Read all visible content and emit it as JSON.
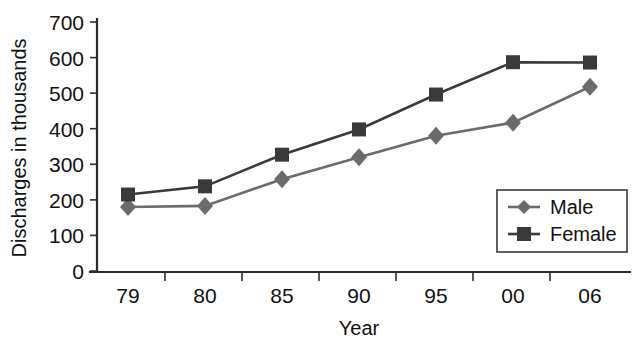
{
  "chart_data": {
    "type": "line",
    "title": "",
    "xlabel": "Year",
    "ylabel": "Discharges in thousands",
    "categories": [
      "79",
      "80",
      "85",
      "90",
      "95",
      "00",
      "06"
    ],
    "series": [
      {
        "name": "Male",
        "marker": "diamond",
        "color": "#6b6b6b",
        "values": [
          180,
          183,
          258,
          320,
          380,
          417,
          518
        ]
      },
      {
        "name": "Female",
        "marker": "square",
        "color": "#3a3a3a",
        "values": [
          215,
          238,
          327,
          398,
          496,
          587,
          586
        ]
      }
    ],
    "ylim": [
      0,
      700
    ],
    "yticks": [
      0,
      100,
      200,
      300,
      400,
      500,
      600,
      700
    ],
    "ytick_labels": [
      "0",
      "100",
      "200",
      "300",
      "400",
      "500",
      "600",
      "700"
    ],
    "grid": false,
    "legend_position": "bottom-right",
    "axis_color": "#2b2b2b",
    "background": "#ffffff"
  },
  "legend": {
    "entries": [
      {
        "label": "Male"
      },
      {
        "label": "Female"
      }
    ]
  }
}
